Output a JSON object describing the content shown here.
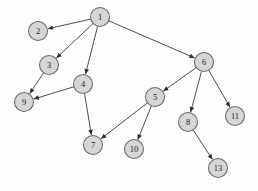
{
  "figure": {
    "title": "",
    "background_color": "#fdfdfd",
    "node_fill_color": "#d6d6d6",
    "node_stroke_color": "#6b6b6b",
    "edge_color": "#3a3a3a",
    "label_color": "#1d1d1d"
  },
  "chart_data": {
    "type": "diagram",
    "diagram_kind": "directed-graph",
    "title": "",
    "xlabel": "",
    "ylabel": "",
    "grid": false,
    "legend": null,
    "node_radius": 9.5,
    "nodes": [
      {
        "id": "1",
        "label": "1",
        "x": 100,
        "y": 17
      },
      {
        "id": "2",
        "label": "2",
        "x": 38,
        "y": 31
      },
      {
        "id": "3",
        "label": "3",
        "x": 49,
        "y": 65
      },
      {
        "id": "4",
        "label": "4",
        "x": 83,
        "y": 84
      },
      {
        "id": "5",
        "label": "5",
        "x": 155,
        "y": 97
      },
      {
        "id": "6",
        "label": "6",
        "x": 204,
        "y": 62
      },
      {
        "id": "7",
        "label": "7",
        "x": 93,
        "y": 145
      },
      {
        "id": "8",
        "label": "8",
        "x": 188,
        "y": 122
      },
      {
        "id": "9",
        "label": "9",
        "x": 24,
        "y": 102
      },
      {
        "id": "10",
        "label": "10",
        "x": 134,
        "y": 149
      },
      {
        "id": "11",
        "label": "11",
        "x": 235,
        "y": 116
      },
      {
        "id": "13",
        "label": "13",
        "x": 218,
        "y": 168
      }
    ],
    "edges": [
      {
        "from": "1",
        "to": "2",
        "directed": true
      },
      {
        "from": "1",
        "to": "3",
        "directed": true
      },
      {
        "from": "1",
        "to": "4",
        "directed": true
      },
      {
        "from": "1",
        "to": "6",
        "directed": true
      },
      {
        "from": "3",
        "to": "9",
        "directed": true
      },
      {
        "from": "4",
        "to": "9",
        "directed": true
      },
      {
        "from": "4",
        "to": "7",
        "directed": true
      },
      {
        "from": "5",
        "to": "7",
        "directed": true
      },
      {
        "from": "5",
        "to": "10",
        "directed": true
      },
      {
        "from": "6",
        "to": "5",
        "directed": true
      },
      {
        "from": "6",
        "to": "8",
        "directed": true
      },
      {
        "from": "6",
        "to": "11",
        "directed": true
      },
      {
        "from": "8",
        "to": "13",
        "directed": true
      }
    ]
  }
}
